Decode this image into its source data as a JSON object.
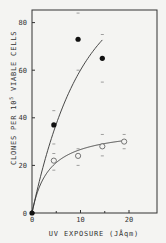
{
  "chart_data": {
    "type": "scatter",
    "title": "",
    "xlabel": "UV EXPOSURE (J/sq m)",
    "ylabel": "CLONES PER 10^5 VIABLE CELLS",
    "xlim": [
      0,
      25
    ],
    "ylim": [
      0,
      85
    ],
    "xticks": [
      "0",
      "10",
      "20"
    ],
    "yticks": [
      "0",
      "20",
      "40",
      "60",
      "80"
    ],
    "grid": false,
    "legend": "none",
    "series": [
      {
        "name": "filled circles",
        "marker": "filled-circle",
        "x": [
          0,
          4.5,
          9.5,
          14.5
        ],
        "y": [
          0,
          37,
          73,
          65
        ],
        "error_low": [
          0,
          25,
          60,
          55
        ],
        "error_high": [
          0,
          43,
          84,
          75
        ]
      },
      {
        "name": "open circles",
        "marker": "open-circle",
        "x": [
          4.5,
          9.5,
          14.5,
          19
        ],
        "y": [
          22,
          24,
          28,
          30
        ],
        "error_low": [
          18,
          20,
          24,
          27
        ],
        "error_high": [
          29,
          27,
          33,
          33
        ]
      }
    ],
    "fit_curves": [
      {
        "series": "filled circles",
        "x_range": [
          0,
          14.5
        ]
      },
      {
        "series": "open circles",
        "x_range": [
          0,
          19
        ]
      }
    ]
  },
  "labels": {
    "xlabel": "UV EXPOSURE  (JÅqm)",
    "ylabel_pre": "CLONES PER 10",
    "ylabel_sup": "5",
    "ylabel_post": " VIABLE CELLS"
  }
}
